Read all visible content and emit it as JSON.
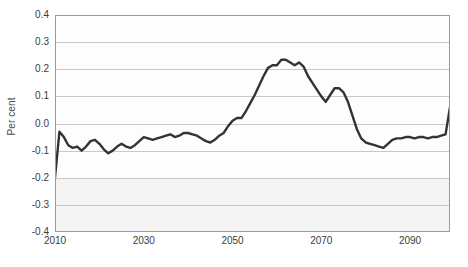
{
  "chart_data": {
    "type": "line",
    "title": "",
    "xlabel": "",
    "ylabel": "Per cent",
    "xlim": [
      2010,
      2099
    ],
    "ylim": [
      -0.4,
      0.4
    ],
    "grid": true,
    "legend": null,
    "y_ticks": [
      0.4,
      0.3,
      0.2,
      0.1,
      0.0,
      -0.1,
      -0.2,
      -0.3,
      -0.4
    ],
    "y_tick_labels": [
      "0.4",
      "0.3",
      "0.2",
      "0.1",
      "0.0",
      "-0.1",
      "-0.2",
      "-0.3",
      "-0.4"
    ],
    "x_ticks": [
      2010,
      2030,
      2050,
      2070,
      2090
    ],
    "x_tick_labels": [
      "2010",
      "2030",
      "2050",
      "2070",
      "2090"
    ],
    "line_color": "#333333",
    "series": [
      {
        "name": "Per cent deviation",
        "x": [
          2010,
          2011,
          2012,
          2013,
          2014,
          2015,
          2016,
          2017,
          2018,
          2019,
          2020,
          2021,
          2022,
          2023,
          2024,
          2025,
          2026,
          2027,
          2028,
          2029,
          2030,
          2031,
          2032,
          2033,
          2034,
          2035,
          2036,
          2037,
          2038,
          2039,
          2040,
          2041,
          2042,
          2043,
          2044,
          2045,
          2046,
          2047,
          2048,
          2049,
          2050,
          2051,
          2052,
          2053,
          2054,
          2055,
          2056,
          2057,
          2058,
          2059,
          2060,
          2061,
          2062,
          2063,
          2064,
          2065,
          2066,
          2067,
          2068,
          2069,
          2070,
          2071,
          2072,
          2073,
          2074,
          2075,
          2076,
          2077,
          2078,
          2079,
          2080,
          2081,
          2082,
          2083,
          2084,
          2085,
          2086,
          2087,
          2088,
          2089,
          2090,
          2091,
          2092,
          2093,
          2094,
          2095,
          2096,
          2097,
          2098,
          2099
        ],
        "y": [
          -0.2,
          -0.03,
          -0.05,
          -0.08,
          -0.09,
          -0.085,
          -0.1,
          -0.085,
          -0.065,
          -0.06,
          -0.075,
          -0.095,
          -0.11,
          -0.1,
          -0.085,
          -0.075,
          -0.085,
          -0.09,
          -0.08,
          -0.065,
          -0.05,
          -0.055,
          -0.06,
          -0.055,
          -0.05,
          -0.045,
          -0.04,
          -0.05,
          -0.045,
          -0.035,
          -0.035,
          -0.04,
          -0.045,
          -0.055,
          -0.065,
          -0.07,
          -0.06,
          -0.045,
          -0.035,
          -0.01,
          0.01,
          0.02,
          0.02,
          0.045,
          0.075,
          0.105,
          0.14,
          0.175,
          0.205,
          0.215,
          0.215,
          0.235,
          0.235,
          0.225,
          0.215,
          0.225,
          0.21,
          0.175,
          0.15,
          0.125,
          0.1,
          0.08,
          0.105,
          0.13,
          0.13,
          0.115,
          0.08,
          0.03,
          -0.02,
          -0.055,
          -0.07,
          -0.075,
          -0.08,
          -0.085,
          -0.09,
          -0.075,
          -0.06,
          -0.055,
          -0.055,
          -0.05,
          -0.05,
          -0.055,
          -0.05,
          -0.05,
          -0.055,
          -0.05,
          -0.05,
          -0.045,
          -0.04,
          0.06
        ]
      }
    ]
  }
}
